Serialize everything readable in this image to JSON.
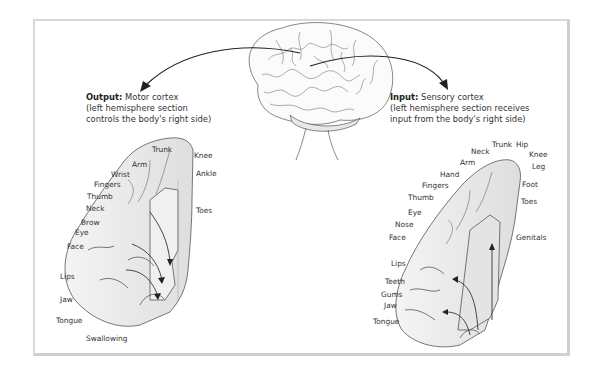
{
  "output_caption": {
    "bold": "Output:",
    "title": "Motor cortex",
    "line2": "(left hemisphere section",
    "line3": "controls the body's right side)"
  },
  "input_caption": {
    "bold": "Input:",
    "title": "Sensory cortex",
    "line2": "(left hemisphere section receives",
    "line3": "input from the body's right side)"
  },
  "motor_labels": {
    "trunk": "Trunk",
    "knee": "Knee",
    "arm": "Arm",
    "ankle": "Ankle",
    "wrist": "Wrist",
    "fingers": "Fingers",
    "thumb": "Thumb",
    "neck": "Neck",
    "toes": "Toes",
    "brow": "Brow",
    "eye": "Eye",
    "face": "Face",
    "lips": "Lips",
    "jaw": "Jaw",
    "tongue": "Tongue",
    "swallowing": "Swallowing"
  },
  "sensory_labels": {
    "trunk": "Trunk",
    "hip": "Hip",
    "neck": "Neck",
    "knee": "Knee",
    "arm": "Arm",
    "leg": "Leg",
    "hand": "Hand",
    "fingers": "Fingers",
    "foot": "Foot",
    "thumb": "Thumb",
    "toes": "Toes",
    "eye": "Eye",
    "nose": "Nose",
    "face": "Face",
    "genitals": "Genitals",
    "lips": "Lips",
    "teeth": "Teeth",
    "gums": "Gums",
    "jaw": "Jaw",
    "tongue": "Tongue"
  }
}
